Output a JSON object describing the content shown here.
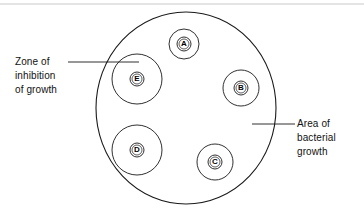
{
  "diagram": {
    "stroke_color": "#1a1a1a",
    "artifact_color": "#c9c9c9",
    "background": "#ffffff",
    "dish": {
      "name": "bacterial-growth-dish",
      "cx": 186,
      "cy": 108,
      "rx": 90,
      "ry": 96
    },
    "discs": [
      {
        "id": "A",
        "letter": "A",
        "cx": 184,
        "cy": 44,
        "zone_r": 15,
        "disc_r": 7,
        "inner_r": 5
      },
      {
        "id": "B",
        "letter": "B",
        "cx": 241,
        "cy": 88,
        "zone_r": 18,
        "disc_r": 7,
        "inner_r": 5
      },
      {
        "id": "C",
        "letter": "C",
        "cx": 215,
        "cy": 162,
        "zone_r": 18,
        "disc_r": 7,
        "inner_r": 5
      },
      {
        "id": "D",
        "letter": "D",
        "cx": 137,
        "cy": 150,
        "zone_r": 25,
        "disc_r": 7,
        "inner_r": 5
      },
      {
        "id": "E",
        "letter": "E",
        "cx": 137,
        "cy": 79,
        "zone_r": 25,
        "disc_r": 7,
        "inner_r": 5
      }
    ],
    "leaders": [
      {
        "name": "zone-leader-line",
        "x1": 68,
        "y1": 62,
        "x2": 139,
        "y2": 62
      },
      {
        "name": "area-leader-line",
        "x1": 252,
        "y1": 124,
        "x2": 295,
        "y2": 124
      }
    ],
    "artifact_line": {
      "x1": 0,
      "y1": 4,
      "x2": 364,
      "y2": 4
    }
  },
  "labels": {
    "zone": {
      "line1": "Zone of",
      "line2": "inhibition",
      "line3": "of growth"
    },
    "area": {
      "line1": "Area of",
      "line2": "bacterial",
      "line3": "growth"
    }
  }
}
